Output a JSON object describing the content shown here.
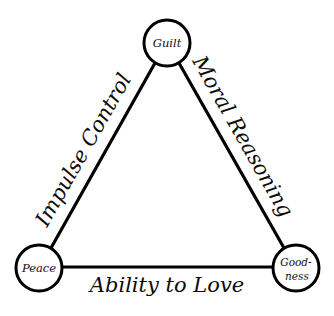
{
  "diagram": {
    "background_color": "#ffffff",
    "stroke_color": "#000000",
    "text_color": "#111111",
    "nodes": [
      {
        "id": "guilt",
        "label": "Guilt",
        "label_line1": "Guilt",
        "label_line2": "",
        "cx": 167,
        "cy": 43,
        "r": 23
      },
      {
        "id": "peace",
        "label": "Peace",
        "label_line1": "Peace",
        "label_line2": "",
        "cx": 39,
        "cy": 268,
        "r": 23
      },
      {
        "id": "goodness",
        "label": "Good-ness",
        "label_line1": "Good-",
        "label_line2": "ness",
        "cx": 296,
        "cy": 268,
        "r": 23
      }
    ],
    "edges": [
      {
        "id": "impulse-control",
        "label": "Impulse Control",
        "from": "peace",
        "to": "guilt",
        "rotation_deg": -60.4
      },
      {
        "id": "moral-reasoning",
        "label": "Moral Reasoning",
        "from": "guilt",
        "to": "goodness",
        "rotation_deg": 60.4
      },
      {
        "id": "ability-to-love",
        "label": "Ability to Love",
        "from": "peace",
        "to": "goodness",
        "rotation_deg": 0
      }
    ]
  }
}
